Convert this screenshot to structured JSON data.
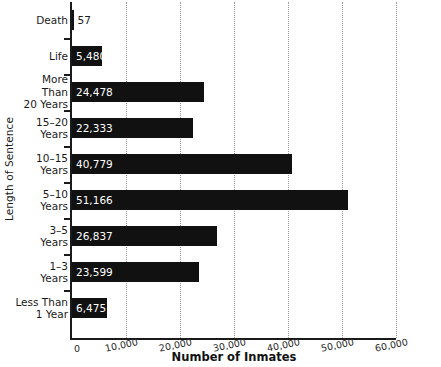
{
  "chart_data": {
    "type": "bar",
    "orientation": "horizontal",
    "title": "",
    "xlabel": "Number of Inmates",
    "ylabel": "Length of Sentence",
    "xlim": [
      0,
      60000
    ],
    "xticks": [
      "0",
      "10,000",
      "20,000",
      "30,000",
      "40,000",
      "50,000",
      "60,000"
    ],
    "xtick_values": [
      0,
      10000,
      20000,
      30000,
      40000,
      50000,
      60000
    ],
    "grid": "vertical-dotted",
    "legend": "none",
    "bar_color": "#111111",
    "categories": [
      "Death",
      "Life",
      "More Than 20 Years",
      "15–20 Years",
      "10–15 Years",
      "5–10 Years",
      "3–5 Years",
      "1–3 Years",
      "Less Than 1 Year"
    ],
    "values": [
      57,
      5480,
      24478,
      22333,
      40779,
      51166,
      26837,
      23599,
      6475
    ],
    "value_labels": [
      "57",
      "5,480",
      "24,478",
      "22,333",
      "40,779",
      "51,166",
      "26,837",
      "23,599",
      "6,475"
    ],
    "label_lines": [
      [
        "Death"
      ],
      [
        "Life"
      ],
      [
        "More Than",
        "20 Years"
      ],
      [
        "15–20",
        "Years"
      ],
      [
        "10–15",
        "Years"
      ],
      [
        "5–10",
        "Years"
      ],
      [
        "3–5",
        "Years"
      ],
      [
        "1–3",
        "Years"
      ],
      [
        "Less Than",
        "1 Year"
      ]
    ],
    "label_placement": [
      "outside",
      "inside",
      "inside",
      "inside",
      "inside",
      "inside",
      "inside",
      "inside",
      "inside"
    ]
  }
}
